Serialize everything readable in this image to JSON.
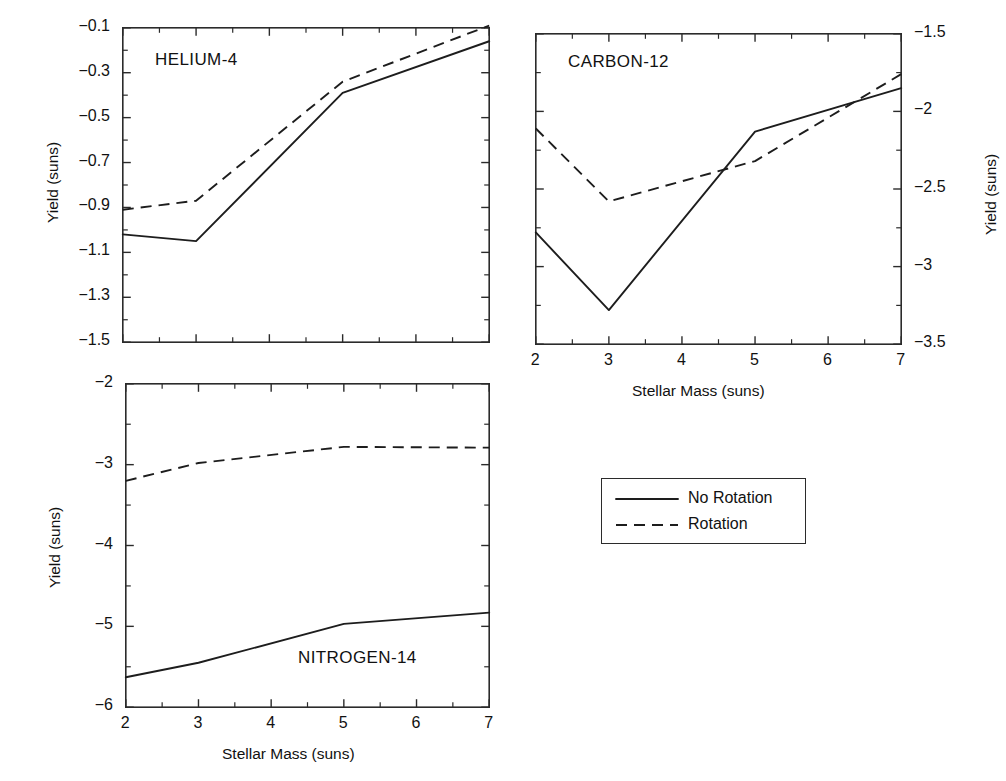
{
  "figure": {
    "width": 1006,
    "height": 781,
    "background": "#ffffff",
    "line_color": "#1d1d1d",
    "axis_color": "#2b2b2b"
  },
  "legend": {
    "position": "center-right",
    "entries": [
      {
        "label": "No Rotation",
        "style": "solid"
      },
      {
        "label": "Rotation",
        "style": "dashed"
      }
    ]
  },
  "chart_data": [
    {
      "type": "line",
      "title": "HELIUM-4",
      "panel": "top-left",
      "xlabel": "",
      "ylabel": "Yield (suns)",
      "ylabel_side": "left",
      "xlim": [
        2,
        7
      ],
      "ylim": [
        -1.5,
        -0.1
      ],
      "grid": false,
      "x_ticks": [
        2,
        3,
        4,
        5,
        6,
        7
      ],
      "x_tick_labels": [
        "",
        "",
        "",
        "",
        "",
        ""
      ],
      "y_ticks": [
        -0.1,
        -0.3,
        -0.5,
        -0.7,
        -0.9,
        -1.1,
        -1.3,
        -1.5
      ],
      "y_tick_labels": [
        "−0.1",
        "−0.3",
        "−0.5",
        "−0.7",
        "−0.9",
        "−1.1",
        "−1.3",
        "−1.5"
      ],
      "x": [
        2,
        3,
        5,
        7
      ],
      "series": [
        {
          "name": "No Rotation",
          "style": "solid",
          "values": [
            -1.02,
            -1.05,
            -0.39,
            -0.16
          ]
        },
        {
          "name": "Rotation",
          "style": "dashed",
          "values": [
            -0.91,
            -0.87,
            -0.34,
            -0.09
          ]
        }
      ]
    },
    {
      "type": "line",
      "title": "CARBON-12",
      "panel": "top-right",
      "xlabel": "Stellar Mass (suns)",
      "ylabel": "Yield (suns)",
      "ylabel_side": "right",
      "xlim": [
        2,
        7
      ],
      "ylim": [
        -3.5,
        -1.5
      ],
      "grid": false,
      "x_ticks": [
        2,
        3,
        4,
        5,
        6,
        7
      ],
      "x_tick_labels": [
        "2",
        "3",
        "4",
        "5",
        "6",
        "7"
      ],
      "y_ticks": [
        -1.5,
        -2,
        -2.5,
        -3,
        -3.5
      ],
      "y_tick_labels": [
        "−1.5",
        "−2",
        "−2.5",
        "−3",
        "−3.5"
      ],
      "x": [
        2,
        3,
        5,
        7
      ],
      "series": [
        {
          "name": "No Rotation",
          "style": "solid",
          "values": [
            -2.78,
            -3.28,
            -2.13,
            -1.85
          ]
        },
        {
          "name": "Rotation",
          "style": "dashed",
          "values": [
            -2.11,
            -2.58,
            -2.32,
            -1.76
          ]
        }
      ]
    },
    {
      "type": "line",
      "title": "NITROGEN-14",
      "panel": "bottom-left",
      "xlabel": "Stellar Mass (suns)",
      "ylabel": "Yield (suns)",
      "ylabel_side": "left",
      "xlim": [
        2,
        7
      ],
      "ylim": [
        -6,
        -2
      ],
      "grid": false,
      "x_ticks": [
        2,
        3,
        4,
        5,
        6,
        7
      ],
      "x_tick_labels": [
        "2",
        "3",
        "4",
        "5",
        "6",
        "7"
      ],
      "y_ticks": [
        -2,
        -3,
        -4,
        -5,
        -6
      ],
      "y_tick_labels": [
        "−2",
        "−3",
        "−4",
        "−5",
        "−6"
      ],
      "x": [
        2,
        3,
        5,
        7
      ],
      "series": [
        {
          "name": "No Rotation",
          "style": "solid",
          "values": [
            -5.63,
            -5.45,
            -4.97,
            -4.83
          ]
        },
        {
          "name": "Rotation",
          "style": "dashed",
          "values": [
            -3.2,
            -2.98,
            -2.78,
            -2.79
          ]
        }
      ]
    }
  ]
}
